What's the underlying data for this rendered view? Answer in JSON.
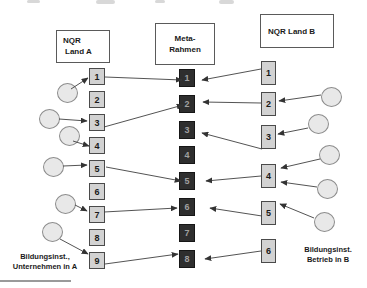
{
  "diagram": {
    "header_left": {
      "line1": "NQR",
      "line2": "Land A"
    },
    "header_middle": {
      "line1": "Meta-",
      "line2": "Rahmen"
    },
    "header_right": {
      "line1": "NQR Land B"
    },
    "left_column": {
      "boxes": [
        "1",
        "2",
        "3",
        "4",
        "5",
        "6",
        "7",
        "8",
        "9"
      ]
    },
    "middle_column": {
      "boxes": [
        "1",
        "2",
        "3",
        "4",
        "5",
        "6",
        "7",
        "8"
      ]
    },
    "right_column": {
      "boxes": [
        "1",
        "2",
        "3",
        "4",
        "5",
        "6"
      ]
    },
    "label_bottom_left": {
      "line1": "Bildungsinst.,",
      "line2": "Unternehmen in A"
    },
    "label_bottom_right": {
      "line1": "Bildungsinst.",
      "line2": "Betrieb in B"
    },
    "connections": [
      {
        "from": "circle-a1",
        "to": "A1"
      },
      {
        "from": "circle-a2",
        "to": "A3"
      },
      {
        "from": "circle-a3",
        "to": "A4"
      },
      {
        "from": "circle-a4",
        "to": "A5"
      },
      {
        "from": "circle-a5",
        "to": "A7"
      },
      {
        "from": "circle-a6",
        "to": "A9"
      },
      {
        "from": "A1",
        "to": "M1"
      },
      {
        "from": "A3",
        "to": "M2"
      },
      {
        "from": "A5",
        "to": "M5"
      },
      {
        "from": "A7",
        "to": "M6"
      },
      {
        "from": "A9",
        "to": "M8"
      },
      {
        "from": "B1",
        "to": "M1"
      },
      {
        "from": "B2",
        "to": "M2"
      },
      {
        "from": "B3",
        "to": "M3"
      },
      {
        "from": "B4",
        "to": "M5"
      },
      {
        "from": "B5",
        "to": "M6"
      },
      {
        "from": "B6",
        "to": "M8"
      },
      {
        "from": "circle-b1",
        "to": "B2"
      },
      {
        "from": "circle-b2",
        "to": "B3"
      },
      {
        "from": "circle-b3",
        "to": "B4"
      },
      {
        "from": "circle-b4",
        "to": "B4"
      },
      {
        "from": "circle-b5",
        "to": "B5"
      }
    ],
    "colors": {
      "country_box_fill": "#d2d2d2",
      "meta_box_fill": "#2e2e2e",
      "meta_box_text": "#a0a0a0",
      "circle_fill": "#e8e8e8",
      "arrow": "#3f3f3f"
    }
  }
}
